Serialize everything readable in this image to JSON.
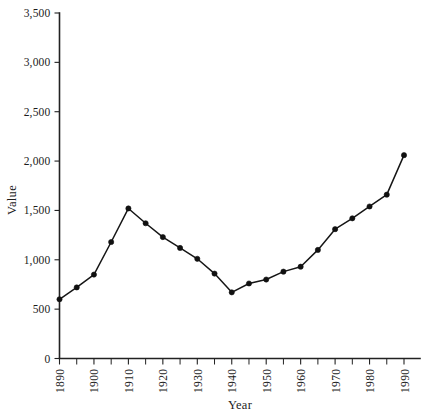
{
  "chart_data": {
    "type": "line",
    "title": "",
    "xlabel": "Year",
    "ylabel": "Value",
    "xlim": [
      1890,
      1990
    ],
    "ylim": [
      0,
      3500
    ],
    "grid": false,
    "legend": null,
    "x": [
      1890,
      1895,
      1900,
      1905,
      1910,
      1915,
      1920,
      1925,
      1930,
      1935,
      1940,
      1945,
      1950,
      1955,
      1960,
      1965,
      1970,
      1975,
      1980,
      1985,
      1990
    ],
    "values": [
      600,
      720,
      850,
      1180,
      1520,
      1370,
      1230,
      1120,
      1010,
      860,
      670,
      760,
      800,
      880,
      930,
      1100,
      1310,
      1420,
      1540,
      1570,
      1660
    ],
    "series": [
      {
        "name": "Value",
        "points": [
          {
            "x": 1890,
            "y": 600
          },
          {
            "x": 1895,
            "y": 720
          },
          {
            "x": 1900,
            "y": 850
          },
          {
            "x": 1905,
            "y": 1180
          },
          {
            "x": 1910,
            "y": 1520
          },
          {
            "x": 1915,
            "y": 1370
          },
          {
            "x": 1920,
            "y": 1230
          },
          {
            "x": 1925,
            "y": 1120
          },
          {
            "x": 1930,
            "y": 1010
          },
          {
            "x": 1935,
            "y": 860
          },
          {
            "x": 1940,
            "y": 670
          },
          {
            "x": 1945,
            "y": 760
          },
          {
            "x": 1950,
            "y": 800
          },
          {
            "x": 1955,
            "y": 880
          },
          {
            "x": 1960,
            "y": 930
          },
          {
            "x": 1965,
            "y": 1100
          },
          {
            "x": 1970,
            "y": 1310
          },
          {
            "x": 1975,
            "y": 1420
          },
          {
            "x": 1980,
            "y": 1540
          },
          {
            "x": 1985,
            "y": 1660
          },
          {
            "x": 1990,
            "y": 2060
          }
        ]
      }
    ],
    "ytick_labels": [
      "0",
      "500",
      "1,000",
      "1,500",
      "2,000",
      "2,500",
      "3,000",
      "3,500"
    ],
    "ytick_values": [
      0,
      500,
      1000,
      1500,
      2000,
      2500,
      3000,
      3500
    ],
    "xtick_labels": [
      "1890",
      "1900",
      "1910",
      "1920",
      "1930",
      "1940",
      "1950",
      "1960",
      "1970",
      "1980",
      "1990"
    ],
    "xtick_values": [
      1890,
      1900,
      1910,
      1920,
      1930,
      1940,
      1950,
      1960,
      1970,
      1980,
      1990
    ],
    "xtick_minor_values": [
      1895,
      1905,
      1915,
      1925,
      1935,
      1945,
      1955,
      1965,
      1975,
      1985
    ],
    "line_color": "#161616",
    "marker_color": "#111111",
    "axis_color": "#222222",
    "background_color": "#ffffff"
  },
  "axes": {
    "x_title": "Year",
    "y_title": "Value"
  }
}
